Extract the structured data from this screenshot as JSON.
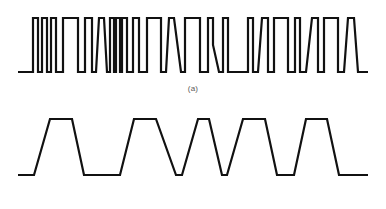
{
  "figure": {
    "background_color": "#ffffff",
    "line_color": "#111111",
    "caption_color": "#5a5a5a",
    "width": 386,
    "height": 209,
    "panels": [
      {
        "id": "a",
        "caption": "(a)",
        "description": "Irregular rectangular pulse train with narrow and wide pulses, some with slanted edges and a partial notch",
        "baseline_y": 72,
        "top_y": 18,
        "x_start": 18,
        "x_end": 368,
        "stroke_width": 2.2
      },
      {
        "id": "b",
        "caption": "(b)",
        "description": "Trapezoidal pulse train with five pulses and sloped rising and falling edges",
        "baseline_y": 175,
        "top_y": 119,
        "x_start": 18,
        "x_end": 368,
        "stroke_width": 2.2,
        "pulse_count": 5
      }
    ]
  },
  "chart_data": {
    "type": "line",
    "title": "",
    "xlabel": "",
    "ylabel": "",
    "grid": false,
    "legend": "none",
    "series": [
      {
        "name": "(a)",
        "panel": "a",
        "y_low": 72,
        "y_high": 18,
        "points": [
          [
            18,
            72
          ],
          [
            33,
            72
          ],
          [
            33,
            18
          ],
          [
            38,
            18
          ],
          [
            38,
            72
          ],
          [
            42,
            72
          ],
          [
            42,
            18
          ],
          [
            47,
            18
          ],
          [
            47,
            72
          ],
          [
            51,
            72
          ],
          [
            51,
            18
          ],
          [
            56,
            18
          ],
          [
            56,
            72
          ],
          [
            63,
            72
          ],
          [
            63,
            18
          ],
          [
            78,
            18
          ],
          [
            78,
            72
          ],
          [
            85,
            72
          ],
          [
            85,
            18
          ],
          [
            92,
            18
          ],
          [
            92,
            72
          ],
          [
            96,
            72
          ],
          [
            99,
            18
          ],
          [
            104,
            18
          ],
          [
            107,
            72
          ],
          [
            110,
            72
          ],
          [
            110,
            18
          ],
          [
            114,
            18
          ],
          [
            114,
            72
          ],
          [
            116,
            72
          ],
          [
            116,
            18
          ],
          [
            120,
            18
          ],
          [
            120,
            72
          ],
          [
            122,
            72
          ],
          [
            122,
            18
          ],
          [
            127,
            18
          ],
          [
            127,
            72
          ],
          [
            133,
            72
          ],
          [
            133,
            18
          ],
          [
            139,
            18
          ],
          [
            139,
            72
          ],
          [
            147,
            72
          ],
          [
            147,
            18
          ],
          [
            161,
            18
          ],
          [
            161,
            72
          ],
          [
            166,
            72
          ],
          [
            169,
            18
          ],
          [
            174,
            18
          ],
          [
            181,
            72
          ],
          [
            185,
            72
          ],
          [
            185,
            18
          ],
          [
            200,
            18
          ],
          [
            200,
            72
          ],
          [
            208,
            72
          ],
          [
            208,
            18
          ],
          [
            213,
            18
          ],
          [
            213,
            45
          ],
          [
            219,
            72
          ],
          [
            223,
            72
          ],
          [
            223,
            18
          ],
          [
            228,
            18
          ],
          [
            228,
            72
          ],
          [
            248,
            72
          ],
          [
            248,
            18
          ],
          [
            253,
            18
          ],
          [
            253,
            72
          ],
          [
            258,
            72
          ],
          [
            262,
            18
          ],
          [
            268,
            18
          ],
          [
            268,
            72
          ],
          [
            274,
            72
          ],
          [
            274,
            18
          ],
          [
            288,
            18
          ],
          [
            288,
            72
          ],
          [
            295,
            72
          ],
          [
            295,
            18
          ],
          [
            300,
            18
          ],
          [
            300,
            72
          ],
          [
            306,
            72
          ],
          [
            312,
            18
          ],
          [
            318,
            18
          ],
          [
            318,
            72
          ],
          [
            324,
            72
          ],
          [
            324,
            18
          ],
          [
            338,
            18
          ],
          [
            338,
            72
          ],
          [
            344,
            72
          ],
          [
            348,
            18
          ],
          [
            354,
            18
          ],
          [
            358,
            72
          ],
          [
            368,
            72
          ]
        ]
      },
      {
        "name": "(b)",
        "panel": "b",
        "y_low": 175,
        "y_high": 119,
        "points": [
          [
            18,
            175
          ],
          [
            34,
            175
          ],
          [
            50,
            119
          ],
          [
            72,
            119
          ],
          [
            84,
            175
          ],
          [
            120,
            175
          ],
          [
            134,
            119
          ],
          [
            156,
            119
          ],
          [
            176,
            175
          ],
          [
            182,
            175
          ],
          [
            198,
            119
          ],
          [
            209,
            119
          ],
          [
            222,
            175
          ],
          [
            227,
            175
          ],
          [
            243,
            119
          ],
          [
            265,
            119
          ],
          [
            277,
            175
          ],
          [
            294,
            175
          ],
          [
            306,
            119
          ],
          [
            327,
            119
          ],
          [
            339,
            175
          ],
          [
            368,
            175
          ]
        ]
      }
    ]
  }
}
